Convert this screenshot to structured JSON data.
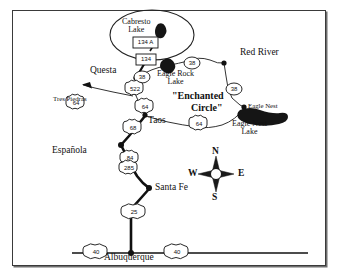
{
  "figure": {
    "type": "road-map",
    "region": "Northern New Mexico",
    "title_annotation": "\"Enchanted Circle\"",
    "frame_color": "#3a3a3a",
    "background_color": "#ffffff",
    "ink_color": "#111111",
    "water_color": "#1a1a1a"
  },
  "cities": [
    {
      "name": "Red River",
      "x": 252,
      "y": 55,
      "dot_x": 224,
      "dot_y": 63
    },
    {
      "name": "Questa",
      "x": 93,
      "y": 73,
      "dot_x": 136,
      "dot_y": 78
    },
    {
      "name": "Eagle Nest",
      "x": 249,
      "y": 106,
      "dot_x": 244,
      "dot_y": 107
    },
    {
      "name": "Taos",
      "x": 146,
      "y": 121,
      "dot_x": 145,
      "dot_y": 115
    },
    {
      "name": "Española",
      "x": 57,
      "y": 152,
      "dot_x": 120,
      "dot_y": 145
    },
    {
      "name": "Santa Fe",
      "x": 155,
      "y": 189,
      "dot_x": 149,
      "dot_y": 188
    },
    {
      "name": "Albuquerque",
      "x": 105,
      "y": 256,
      "dot_x": 131,
      "dot_y": 253
    },
    {
      "name": "Tres Piedras",
      "x": 59,
      "y": 99,
      "dot_x": 0,
      "dot_y": 0
    }
  ],
  "lakes": [
    {
      "name": "Cabresto\nLake",
      "label_x": 130,
      "label_y": 23
    },
    {
      "name": "Eagle Rock\nLake",
      "label_x": 165,
      "label_y": 75
    },
    {
      "name": "Eagle Nest\nLake",
      "label_x": 237,
      "label_y": 124
    }
  ],
  "annotations": [
    {
      "text": "\"Enchanted",
      "x": 176,
      "y": 97
    },
    {
      "text": "Circle\"",
      "x": 195,
      "y": 108
    }
  ],
  "route_shields": [
    {
      "label": "134 A",
      "type": "state-rect",
      "x": 142,
      "y": 43
    },
    {
      "label": "134",
      "type": "state-rect",
      "x": 144,
      "y": 60
    },
    {
      "label": "38",
      "type": "state-oval",
      "x": 142,
      "y": 75
    },
    {
      "label": "38",
      "type": "state-oval",
      "x": 192,
      "y": 61
    },
    {
      "label": "38",
      "type": "state-oval",
      "x": 234,
      "y": 87
    },
    {
      "label": "522",
      "type": "us-shield",
      "x": 133,
      "y": 90
    },
    {
      "label": "64",
      "type": "us-shield",
      "x": 74,
      "y": 104
    },
    {
      "label": "64",
      "type": "us-shield",
      "x": 143,
      "y": 108
    },
    {
      "label": "64",
      "type": "us-shield",
      "x": 197,
      "y": 125
    },
    {
      "label": "68",
      "type": "us-shield",
      "x": 131,
      "y": 129
    },
    {
      "label": "84",
      "type": "us-shield",
      "x": 128,
      "y": 160
    },
    {
      "label": "285",
      "type": "us-shield",
      "x": 128,
      "y": 170
    },
    {
      "label": "25",
      "type": "interstate",
      "x": 129,
      "y": 214
    },
    {
      "label": "40",
      "type": "interstate",
      "x": 91,
      "y": 254
    },
    {
      "label": "40",
      "type": "interstate",
      "x": 172,
      "y": 254
    }
  ],
  "compass": {
    "center_x": 216,
    "center_y": 175,
    "north": "N",
    "east": "E",
    "south": "S",
    "west": "W"
  }
}
